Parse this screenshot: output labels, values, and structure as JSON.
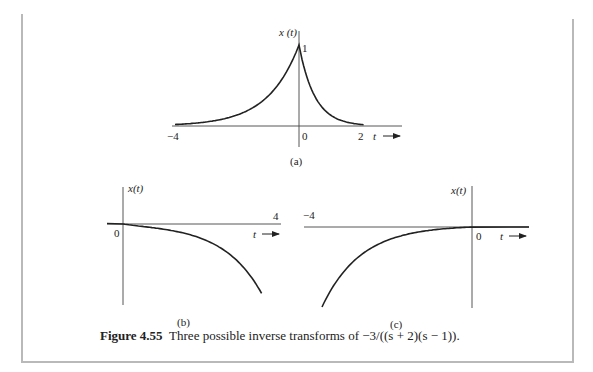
{
  "figure": {
    "number_label": "Figure 4.55",
    "caption_text": "Three possible inverse transforms of −3/((s + 2)(s − 1))."
  },
  "panels": [
    {
      "id": "a",
      "sublabel": "(a)",
      "ylabel": "x (t)",
      "xlabel": "t",
      "peak_label": "1",
      "ticks": [
        "−4",
        "0",
        "2"
      ],
      "description": "two-sided signal: e^{t} for t<0, e^{-2t} for t>0"
    },
    {
      "id": "b",
      "sublabel": "(b)",
      "ylabel": "x(t)",
      "xlabel": "t",
      "ticks": [
        "0",
        "4"
      ],
      "description": "right-sided: -(e^{t} - e^{-2t}) for t>0, diverging negative"
    },
    {
      "id": "c",
      "sublabel": "(c)",
      "ylabel": "x(t)",
      "xlabel": "t",
      "ticks": [
        "−4",
        "0"
      ],
      "description": "left-sided: (e^{t} - e^{-2t}) for t<0, diverging negative as t→−∞"
    }
  ],
  "chart_data": [
    {
      "type": "line",
      "title": "(a)",
      "xlabel": "t",
      "ylabel": "x (t)",
      "xlim": [
        -4,
        2.2
      ],
      "ylim": [
        0,
        1
      ],
      "xticks": [
        -4,
        0,
        2
      ],
      "series": [
        {
          "name": "x(t)",
          "x": [
            -4,
            -3,
            -2,
            -1,
            -0.5,
            0,
            0.25,
            0.5,
            1,
            1.5,
            2
          ],
          "y": [
            0.018,
            0.05,
            0.135,
            0.368,
            0.607,
            1,
            0.607,
            0.368,
            0.135,
            0.05,
            0.018
          ]
        }
      ]
    },
    {
      "type": "line",
      "title": "(b)",
      "xlabel": "t",
      "ylabel": "x(t)",
      "xticks": [
        0,
        4
      ],
      "series": [
        {
          "name": "x(t)",
          "x": [
            -0.5,
            0,
            1,
            2,
            3,
            3.6
          ],
          "y": [
            0,
            0,
            -0.03,
            -0.12,
            -0.4,
            -0.8
          ]
        }
      ]
    },
    {
      "type": "line",
      "title": "(c)",
      "xlabel": "t",
      "ylabel": "x(t)",
      "xticks": [
        -4,
        0
      ],
      "series": [
        {
          "name": "x(t)",
          "x": [
            -3.6,
            -3,
            -2,
            -1,
            0,
            0.5
          ],
          "y": [
            -0.8,
            -0.4,
            -0.12,
            -0.03,
            0,
            0
          ]
        }
      ]
    }
  ]
}
